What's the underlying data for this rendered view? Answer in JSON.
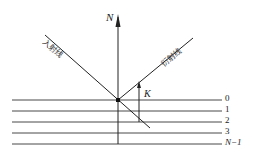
{
  "diagram": {
    "normal_label": "N",
    "incident_label": "入射线",
    "diffracted_label": "衍射线",
    "vector_label": "K",
    "layers": [
      {
        "label": "0"
      },
      {
        "label": "1"
      },
      {
        "label": "2"
      },
      {
        "label": "3"
      },
      {
        "label": "N−1"
      }
    ],
    "colors": {
      "line": "#222222",
      "background": "#ffffff"
    }
  }
}
